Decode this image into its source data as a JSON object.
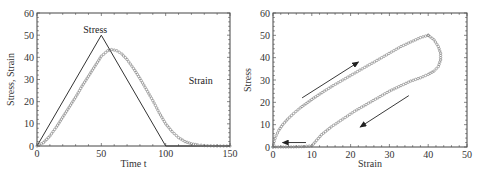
{
  "chart_data": [
    {
      "id": "left",
      "type": "line",
      "title": "",
      "xlabel": "Time t",
      "ylabel": "Stress, Strain",
      "xlim": [
        0,
        150
      ],
      "ylim": [
        0,
        60
      ],
      "xticks": [
        0,
        50,
        100,
        150
      ],
      "yticks": [
        0,
        10,
        20,
        30,
        40,
        50,
        60
      ],
      "grid": false,
      "legend": "none",
      "annotations": [
        {
          "text": "Stress",
          "x": 36,
          "y": 51
        },
        {
          "text": "Strain",
          "x": 118,
          "y": 28
        }
      ],
      "series": [
        {
          "name": "Stress",
          "style": "solid-line",
          "x": [
            0,
            50,
            100,
            150
          ],
          "y": [
            0,
            50,
            0,
            0
          ]
        },
        {
          "name": "Strain",
          "style": "circle-markers",
          "x": [
            0,
            5,
            10,
            15,
            20,
            25,
            30,
            35,
            40,
            45,
            50,
            55,
            58,
            62,
            66,
            70,
            75,
            80,
            85,
            90,
            95,
            100,
            105,
            110,
            115,
            120,
            125,
            130,
            135,
            140,
            145,
            150
          ],
          "y": [
            0,
            1.5,
            4.5,
            8.5,
            13,
            17.5,
            22,
            27,
            31.5,
            36,
            40.5,
            43,
            43.5,
            43,
            41.5,
            39,
            35,
            30.5,
            25.5,
            20.5,
            15,
            10,
            6.5,
            3.8,
            2,
            1,
            0.5,
            0.2,
            0.1,
            0,
            0,
            0
          ]
        }
      ]
    },
    {
      "id": "right",
      "type": "scatter",
      "title": "",
      "xlabel": "Strain",
      "ylabel": "Stress",
      "xlim": [
        0,
        50
      ],
      "ylim": [
        0,
        60
      ],
      "xticks": [
        0,
        10,
        20,
        30,
        40,
        50
      ],
      "yticks": [
        0,
        10,
        20,
        30,
        40,
        50,
        60
      ],
      "grid": false,
      "legend": "none",
      "annotations": [
        {
          "type": "arrow",
          "from": [
            7.5,
            22
          ],
          "to": [
            22,
            38
          ],
          "meaning": "loading"
        },
        {
          "type": "arrow",
          "from": [
            35,
            23
          ],
          "to": [
            22.5,
            9
          ],
          "meaning": "unloading"
        },
        {
          "type": "arrow",
          "from": [
            8.5,
            2
          ],
          "to": [
            2.5,
            2
          ],
          "meaning": "recovery"
        }
      ],
      "series": [
        {
          "name": "Loading",
          "style": "circle-markers",
          "x": [
            0,
            0.3,
            0.8,
            1.5,
            2.5,
            3.8,
            5.3,
            7,
            9,
            11,
            13.2,
            15.5,
            18,
            20.5,
            23,
            25.5,
            28,
            30.5,
            33,
            35.5,
            38,
            40
          ],
          "y": [
            0,
            2.5,
            5,
            7.5,
            10,
            12.5,
            15,
            17.5,
            20,
            22.5,
            25,
            27.5,
            30,
            32.5,
            35,
            37.5,
            40,
            42.5,
            45,
            47,
            49,
            50
          ]
        },
        {
          "name": "Unloading",
          "style": "circle-markers",
          "x": [
            40,
            41.5,
            42.6,
            43.2,
            43.2,
            42.6,
            41.5,
            40,
            38,
            35.5,
            33,
            30,
            27,
            24,
            21,
            18,
            15,
            12.5,
            10,
            8,
            6,
            4,
            2,
            0
          ],
          "y": [
            50,
            48,
            45,
            42,
            39,
            36,
            34,
            32.5,
            31,
            29.5,
            27.5,
            25,
            22,
            19,
            16,
            12.5,
            9,
            5.5,
            0.5,
            0.2,
            0.1,
            0,
            0,
            0
          ]
        }
      ]
    }
  ]
}
